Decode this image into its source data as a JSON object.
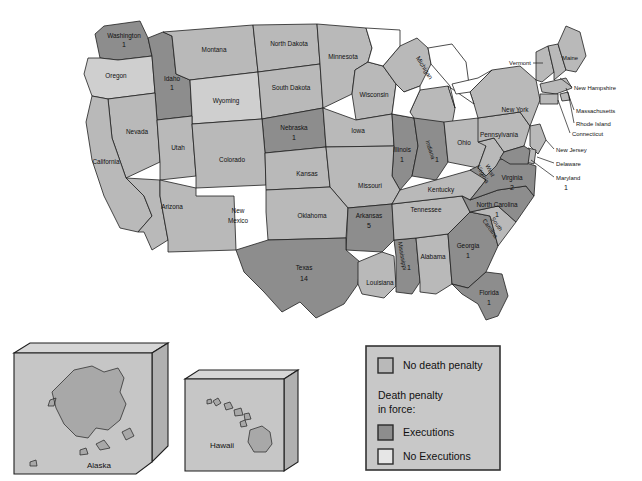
{
  "map": {
    "title": "United States death penalty status map",
    "colors": {
      "no_death_penalty": "#b9b9b9",
      "executions": "#8d8d8d",
      "no_executions": "#cfcfcf",
      "background": "#ffffff",
      "outline": "#1f1f1f"
    },
    "states": [
      {
        "name": "Washington",
        "count": "1",
        "category": "executions"
      },
      {
        "name": "Oregon",
        "count": "",
        "category": "no_executions"
      },
      {
        "name": "Idaho",
        "count": "1",
        "category": "executions"
      },
      {
        "name": "Montana",
        "count": "",
        "category": "no_death_penalty"
      },
      {
        "name": "Wyoming",
        "count": "",
        "category": "no_executions"
      },
      {
        "name": "North Dakota",
        "count": "",
        "category": "no_death_penalty"
      },
      {
        "name": "South Dakota",
        "count": "",
        "category": "no_death_penalty"
      },
      {
        "name": "Minnesota",
        "count": "",
        "category": "no_death_penalty"
      },
      {
        "name": "Wisconsin",
        "count": "",
        "category": "no_death_penalty"
      },
      {
        "name": "Michigan",
        "count": "",
        "category": "no_death_penalty"
      },
      {
        "name": "Nebraska",
        "count": "1",
        "category": "executions"
      },
      {
        "name": "Iowa",
        "count": "",
        "category": "no_death_penalty"
      },
      {
        "name": "Illinois",
        "count": "1",
        "category": "executions"
      },
      {
        "name": "Indiana",
        "count": "1",
        "category": "executions"
      },
      {
        "name": "Ohio",
        "count": "",
        "category": "no_death_penalty"
      },
      {
        "name": "Nevada",
        "count": "",
        "category": "no_death_penalty"
      },
      {
        "name": "Utah",
        "count": "",
        "category": "no_death_penalty"
      },
      {
        "name": "Colorado",
        "count": "",
        "category": "no_death_penalty"
      },
      {
        "name": "California",
        "count": "",
        "category": "no_death_penalty"
      },
      {
        "name": "Arizona",
        "count": "",
        "category": "no_death_penalty"
      },
      {
        "name": "New Mexico",
        "count": "",
        "category": "no_death_penalty"
      },
      {
        "name": "Kansas",
        "count": "",
        "category": "no_death_penalty"
      },
      {
        "name": "Missouri",
        "count": "",
        "category": "no_death_penalty"
      },
      {
        "name": "Oklahoma",
        "count": "",
        "category": "no_death_penalty"
      },
      {
        "name": "Arkansas",
        "count": "5",
        "category": "executions"
      },
      {
        "name": "Texas",
        "count": "14",
        "category": "executions"
      },
      {
        "name": "Louisiana",
        "count": "",
        "category": "no_death_penalty"
      },
      {
        "name": "Mississippi",
        "count": "1",
        "category": "executions"
      },
      {
        "name": "Alabama",
        "count": "",
        "category": "no_death_penalty"
      },
      {
        "name": "Tennessee",
        "count": "",
        "category": "no_death_penalty"
      },
      {
        "name": "Kentucky",
        "count": "",
        "category": "no_death_penalty"
      },
      {
        "name": "Georgia",
        "count": "1",
        "category": "executions"
      },
      {
        "name": "Florida",
        "count": "1",
        "category": "executions"
      },
      {
        "name": "South Carolina",
        "count": "",
        "category": "no_death_penalty"
      },
      {
        "name": "North Carolina",
        "count": "1",
        "category": "executions"
      },
      {
        "name": "Virginia",
        "count": "2",
        "category": "executions"
      },
      {
        "name": "West Virginia",
        "count": "",
        "category": "no_death_penalty"
      },
      {
        "name": "Pennsylvania",
        "count": "",
        "category": "no_death_penalty"
      },
      {
        "name": "New York",
        "count": "",
        "category": "no_death_penalty"
      },
      {
        "name": "Vermont",
        "count": "",
        "category": "no_death_penalty"
      },
      {
        "name": "Maine",
        "count": "",
        "category": "no_death_penalty"
      },
      {
        "name": "New Hampshire",
        "count": "",
        "category": "no_death_penalty"
      },
      {
        "name": "Massachusetts",
        "count": "",
        "category": "no_death_penalty"
      },
      {
        "name": "Rhode Island",
        "count": "",
        "category": "no_death_penalty"
      },
      {
        "name": "Connecticut",
        "count": "",
        "category": "no_death_penalty"
      },
      {
        "name": "New Jersey",
        "count": "",
        "category": "no_death_penalty"
      },
      {
        "name": "Delaware",
        "count": "",
        "category": "no_death_penalty"
      },
      {
        "name": "Maryland",
        "count": "1",
        "category": "executions"
      },
      {
        "name": "Alaska",
        "count": "",
        "category": "no_death_penalty"
      },
      {
        "name": "Hawaii",
        "count": "",
        "category": "no_death_penalty"
      }
    ]
  },
  "insets": {
    "alaska_label": "Alaska",
    "hawaii_label": "Hawaii"
  },
  "legend": {
    "entries": [
      {
        "label": "No death penalty",
        "swatch": "no_death_penalty",
        "color": "#b9b9b9"
      },
      {
        "label": "Executions",
        "swatch": "executions",
        "color": "#8d8d8d"
      },
      {
        "label": "No Executions",
        "swatch": "no_executions",
        "color": "#e6e6e6"
      }
    ],
    "heading_line1": "Death penalty",
    "heading_line2": "in force:"
  }
}
